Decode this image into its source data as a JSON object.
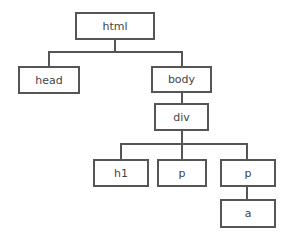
{
  "diagram": {
    "type": "tree",
    "nodes": [
      {
        "id": "html",
        "label": "html"
      },
      {
        "id": "head",
        "label": "head"
      },
      {
        "id": "body",
        "label": "body"
      },
      {
        "id": "div",
        "label": "div"
      },
      {
        "id": "h1",
        "label": "h1"
      },
      {
        "id": "p1",
        "label": "p"
      },
      {
        "id": "p2",
        "label": "p"
      },
      {
        "id": "a",
        "label": "a"
      }
    ],
    "edges": [
      [
        "html",
        "head"
      ],
      [
        "html",
        "body"
      ],
      [
        "body",
        "div"
      ],
      [
        "div",
        "h1"
      ],
      [
        "div",
        "p1"
      ],
      [
        "div",
        "p2"
      ],
      [
        "p2",
        "a"
      ]
    ]
  }
}
